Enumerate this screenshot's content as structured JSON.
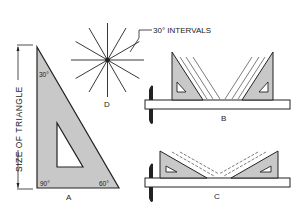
{
  "figure": {
    "colors": {
      "fill": "#c8c8c8",
      "line": "#222222",
      "background": "#ffffff"
    },
    "labels": {
      "size_of_triangle": "SIZE OF TRIANGLE",
      "angle_30": "30°",
      "angle_90": "90°",
      "angle_60": "60°",
      "intervals": "30° INTERVALS",
      "view_a": "A",
      "view_b": "B",
      "view_c": "C",
      "view_d": "D"
    }
  }
}
